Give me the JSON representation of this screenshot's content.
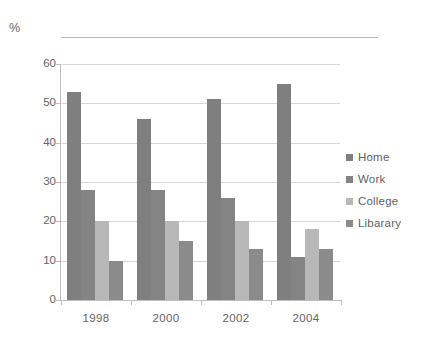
{
  "unit_label": "%",
  "title": "",
  "chart_data": {
    "type": "bar",
    "title": "",
    "subtitle": "",
    "xlabel": "",
    "ylabel": "%",
    "ylim": [
      0,
      60
    ],
    "yticks": [
      0,
      10,
      20,
      30,
      40,
      50,
      60
    ],
    "grid": true,
    "legend_position": "right",
    "categories": [
      "1998",
      "2000",
      "2002",
      "2004"
    ],
    "series": [
      {
        "name": "Home",
        "color": "#7f7f7f",
        "values": [
          53,
          46,
          51,
          55
        ]
      },
      {
        "name": "Work",
        "color": "#848484",
        "values": [
          28,
          28,
          26,
          11
        ]
      },
      {
        "name": "College",
        "color": "#b8b8b8",
        "values": [
          20,
          20,
          20,
          18
        ]
      },
      {
        "name": "Libarary",
        "color": "#8b8b8b",
        "values": [
          10,
          15,
          13,
          13
        ]
      }
    ]
  },
  "legend": {
    "items": [
      {
        "label": "Home",
        "color": "#7f7f7f"
      },
      {
        "label": "Work",
        "color": "#848484"
      },
      {
        "label": "College",
        "color": "#b8b8b8"
      },
      {
        "label": "Libarary",
        "color": "#8b8b8b"
      }
    ]
  },
  "axis": {
    "y_tick_labels": [
      "60",
      "50",
      "40",
      "30",
      "20",
      "10",
      "0"
    ],
    "x_tick_labels": [
      "1998",
      "2000",
      "2002",
      "2004"
    ]
  }
}
